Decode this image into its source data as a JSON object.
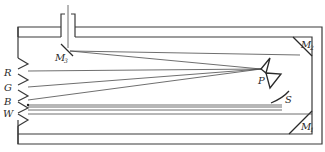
{
  "diagram": {
    "type": "optical-apparatus-schematic",
    "labels": {
      "m1": {
        "main": "M",
        "sub": "1"
      },
      "m2": {
        "main": "M",
        "sub": "2"
      },
      "m3": {
        "main": "M",
        "sub": "3"
      },
      "p": "P",
      "s": "S",
      "r": "R",
      "g": "G",
      "b": "B",
      "w": "W"
    },
    "components": [
      {
        "id": "M1",
        "role": "mirror",
        "position": "bottom-right corner"
      },
      {
        "id": "M2",
        "role": "mirror",
        "position": "top-right corner"
      },
      {
        "id": "M3",
        "role": "mirror",
        "position": "below entrance slit, top-left"
      },
      {
        "id": "P",
        "role": "prism",
        "position": "right-center"
      },
      {
        "id": "S",
        "role": "screen/arc",
        "position": "lower right"
      },
      {
        "id": "R",
        "role": "output slit",
        "position": "left"
      },
      {
        "id": "G",
        "role": "output slit",
        "position": "left"
      },
      {
        "id": "B",
        "role": "output slit",
        "position": "left"
      },
      {
        "id": "W",
        "role": "output slit",
        "position": "left"
      }
    ],
    "colors": {
      "stroke": "#3a3a3a",
      "background": "#ffffff"
    }
  }
}
